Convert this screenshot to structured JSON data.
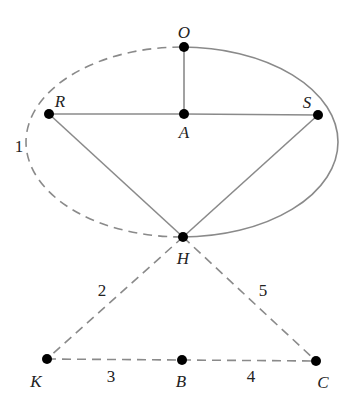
{
  "diagram": {
    "type": "graph",
    "colors": {
      "line": "#8a8a8a",
      "node": "#000000",
      "label": "#222222",
      "background": "#ffffff"
    },
    "ellipse": {
      "cx": 182,
      "cy": 142,
      "rx": 156,
      "ry": 95,
      "solid_half": "right (O→S side→H)",
      "dashed_half": "left (H→R side→O)"
    },
    "nodes": [
      {
        "id": "O",
        "label": "O",
        "x": 184,
        "y": 47,
        "lx": 184,
        "ly": 32
      },
      {
        "id": "R",
        "label": "R",
        "x": 49,
        "y": 114,
        "lx": 60,
        "ly": 101
      },
      {
        "id": "A",
        "label": "A",
        "x": 184,
        "y": 114,
        "lx": 184,
        "ly": 132
      },
      {
        "id": "S",
        "label": "S",
        "x": 318,
        "y": 115,
        "lx": 307,
        "ly": 102
      },
      {
        "id": "H",
        "label": "H",
        "x": 183,
        "y": 237,
        "lx": 183,
        "ly": 258
      },
      {
        "id": "K",
        "label": "K",
        "x": 47,
        "y": 359,
        "lx": 36,
        "ly": 381
      },
      {
        "id": "B",
        "label": "B",
        "x": 182,
        "y": 360,
        "lx": 181,
        "ly": 381
      },
      {
        "id": "C",
        "label": "C",
        "x": 316,
        "y": 361,
        "lx": 323,
        "ly": 382
      }
    ],
    "edges": [
      {
        "from": "O",
        "to": "A",
        "style": "solid"
      },
      {
        "from": "R",
        "to": "A",
        "style": "solid"
      },
      {
        "from": "A",
        "to": "S",
        "style": "solid"
      },
      {
        "from": "R",
        "to": "H",
        "style": "solid"
      },
      {
        "from": "S",
        "to": "H",
        "style": "solid"
      },
      {
        "from": "H",
        "to": "K",
        "style": "dashed",
        "label": "2"
      },
      {
        "from": "H",
        "to": "C",
        "style": "dashed",
        "label": "5"
      },
      {
        "from": "K",
        "to": "B",
        "style": "dashed",
        "label": "3"
      },
      {
        "from": "B",
        "to": "C",
        "style": "dashed",
        "label": "4"
      }
    ],
    "edge_labels": [
      {
        "text": "1",
        "x": 19,
        "y": 146
      },
      {
        "text": "2",
        "x": 102,
        "y": 290
      },
      {
        "text": "5",
        "x": 263,
        "y": 290
      },
      {
        "text": "3",
        "x": 111,
        "y": 376
      },
      {
        "text": "4",
        "x": 251,
        "y": 376
      }
    ]
  }
}
